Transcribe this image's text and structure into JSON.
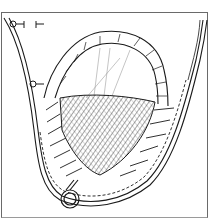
{
  "figure": {
    "type": "line-illustration",
    "style": "black ink on white, technical/medical drawing",
    "colors": {
      "background": "#ffffff",
      "ink": "#1a1a1a",
      "frame": "#6a6a6a",
      "hatch": "#3a3a3a"
    },
    "elements": [
      {
        "name": "outer-pouch-outline",
        "description": "U-shaped outer tissue wall with dashed stitch line"
      },
      {
        "name": "rolled-flap",
        "description": "Arched folded flap at top with radial stitch marks"
      },
      {
        "name": "mesh-patch",
        "description": "Crosshatched triangular mesh region in center"
      },
      {
        "name": "suture-lines",
        "description": "Diagonal suture ticks along left and right edges of mesh"
      },
      {
        "name": "ring",
        "description": "Small ring/loop at bottom of pouch"
      },
      {
        "name": "clamp-markers",
        "description": "Two small T-shaped markers at upper-left"
      }
    ]
  }
}
